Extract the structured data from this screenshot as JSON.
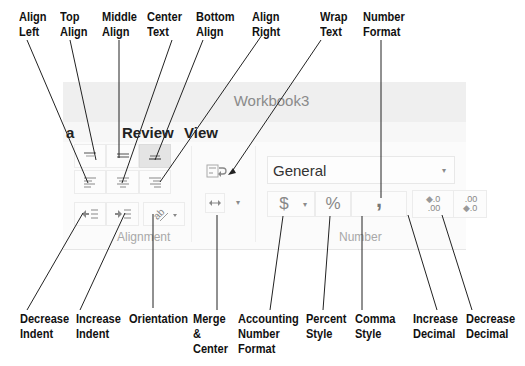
{
  "window": {
    "title": "Workbook3"
  },
  "tabs": [
    {
      "label": "a"
    },
    {
      "label": "Review"
    },
    {
      "label": "View"
    }
  ],
  "alignment_group": {
    "label": "Alignment",
    "buttons": [
      {
        "name": "top-align",
        "icon": "align-top-icon",
        "pressed": false
      },
      {
        "name": "middle-align",
        "icon": "align-middle-icon",
        "pressed": false
      },
      {
        "name": "bottom-align",
        "icon": "align-bottom-icon",
        "pressed": true
      },
      {
        "name": "align-left",
        "icon": "align-left-icon"
      },
      {
        "name": "center-text",
        "icon": "align-center-icon"
      },
      {
        "name": "align-right",
        "icon": "align-right-icon"
      },
      {
        "name": "decrease-indent",
        "icon": "decrease-indent-icon"
      },
      {
        "name": "increase-indent",
        "icon": "increase-indent-icon"
      },
      {
        "name": "orientation",
        "icon": "orientation-icon",
        "has_dropdown": true
      }
    ]
  },
  "wrap_merge": {
    "wrap_text_icon": "wrap-text-icon",
    "merge_center_icon": "merge-center-icon",
    "merge_dropdown_glyph": "▾"
  },
  "number_group": {
    "label": "Number",
    "format_select": {
      "value": "General",
      "caret": "▾"
    },
    "accounting_glyph": "$",
    "accounting_caret": "▾",
    "percent_glyph": "%",
    "comma_glyph": ",",
    "increase_decimal": {
      "top": ".0",
      "bottom": ".00"
    },
    "decrease_decimal": {
      "top": ".00",
      "bottom": ".0"
    }
  },
  "callouts": {
    "top": [
      {
        "text": "Align\nLeft"
      },
      {
        "text": "Top\nAlign"
      },
      {
        "text": "Middle\nAlign"
      },
      {
        "text": "Center\nText"
      },
      {
        "text": "Bottom\nAlign"
      },
      {
        "text": "Align\nRight"
      },
      {
        "text": "Wrap\nText"
      },
      {
        "text": "Number\nFormat"
      }
    ],
    "bottom": [
      {
        "text": "Decrease\nIndent"
      },
      {
        "text": "Increase\nIndent"
      },
      {
        "text": "Orientation"
      },
      {
        "text": "Merge\n&\nCenter"
      },
      {
        "text": "Accounting\nNumber\nFormat"
      },
      {
        "text": "Percent\nStyle"
      },
      {
        "text": "Comma\nStyle"
      },
      {
        "text": "Increase\nDecimal"
      },
      {
        "text": "Decrease\nDecimal"
      }
    ]
  },
  "colors": {
    "ribbon_bg": "#fbfbfb",
    "titlebar_bg": "#efefef",
    "pressed_bg": "#e4e4e4",
    "icon_gray": "#8a8a8a",
    "callout_line": "#222222"
  }
}
